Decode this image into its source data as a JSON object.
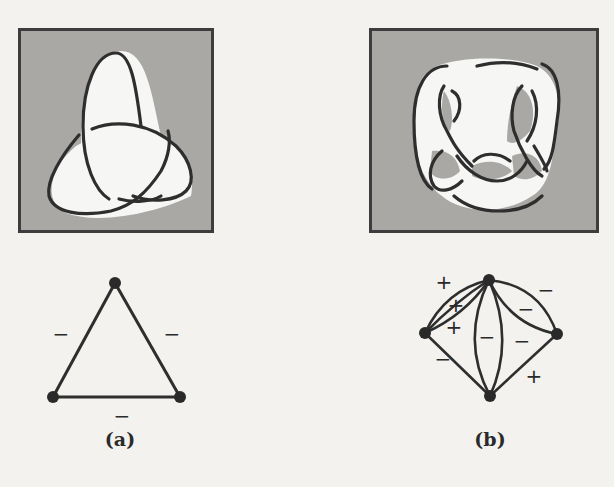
{
  "figure": {
    "panels": [
      {
        "id": "a",
        "caption": "(a)",
        "knot": "trefoil-knot",
        "graph": {
          "vertices": 3,
          "edges": [
            {
              "sign": "−"
            },
            {
              "sign": "−"
            },
            {
              "sign": "−"
            }
          ]
        }
      },
      {
        "id": "b",
        "caption": "(b)",
        "knot": "complex-knot",
        "graph": {
          "vertices": 4,
          "signs": [
            "+",
            "+",
            "+",
            "−",
            "−",
            "−",
            "−",
            "−",
            "+"
          ]
        }
      }
    ],
    "colors": {
      "shade": "#a9a8a5",
      "ink": "#2a2a2a",
      "paper": "#f3f2ef"
    }
  }
}
